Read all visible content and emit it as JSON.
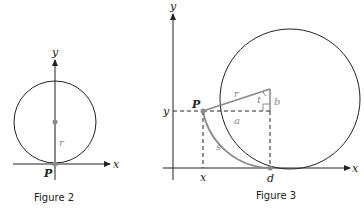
{
  "figure2": {
    "caption": "Figure 2",
    "axis_x_label": "x",
    "axis_y_label": "y",
    "point_label": "P",
    "radius_label": "r"
  },
  "figure3": {
    "caption": "Figure 3",
    "axis_x_label": "x",
    "axis_y_label": "y",
    "point_label": "P",
    "radius_label": "r",
    "angle_label": "t",
    "horizontal_leg_label": "a",
    "vertical_leg_label": "b",
    "arc_label": "s",
    "x_tick_label": "x",
    "y_tick_label": "y",
    "contact_label": "d"
  },
  "colors": {
    "stroke": "#222222",
    "accent_gray": "#8a8a8a"
  }
}
